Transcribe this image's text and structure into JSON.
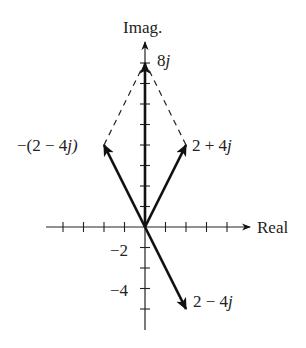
{
  "figure": {
    "top_cutoff_text": "",
    "axis_labels": {
      "imag": "Imag.",
      "real": "Real"
    },
    "tick_labels": {
      "neg2": "−2",
      "neg4": "−4"
    },
    "vectors": [
      {
        "name": "2 + 4j",
        "label_prefix": "2 + 4",
        "label_suffix": "j",
        "re": 2,
        "im": 4,
        "style": "solid"
      },
      {
        "name": "-(2 - 4j)",
        "label_prefix": "−(2 − 4",
        "label_suffix": "j)",
        "re": -2,
        "im": 4,
        "style": "solid"
      },
      {
        "name": "2 - 4j",
        "label_prefix": "2 − 4",
        "label_suffix": "j",
        "re": 2,
        "im": -4,
        "style": "solid"
      },
      {
        "name": "8j",
        "label_prefix": "8",
        "label_suffix": "j",
        "re": 0,
        "im": 8,
        "style": "solid"
      }
    ],
    "dashed_lines": [
      {
        "from": [
          -2,
          4
        ],
        "to": [
          0,
          8
        ]
      },
      {
        "from": [
          2,
          4
        ],
        "to": [
          0,
          8
        ]
      }
    ],
    "axes": {
      "real_ticks": [
        -4,
        -3,
        -2,
        -1,
        1,
        2,
        3,
        4
      ],
      "imag_ticks": [
        -4,
        -3,
        -2,
        -1,
        1,
        2,
        3,
        4,
        5,
        6,
        7,
        8
      ],
      "real_range": [
        -4.8,
        5
      ],
      "imag_range": [
        -5,
        9
      ]
    },
    "colors": {
      "line": "#111111",
      "text": "#222222"
    }
  }
}
